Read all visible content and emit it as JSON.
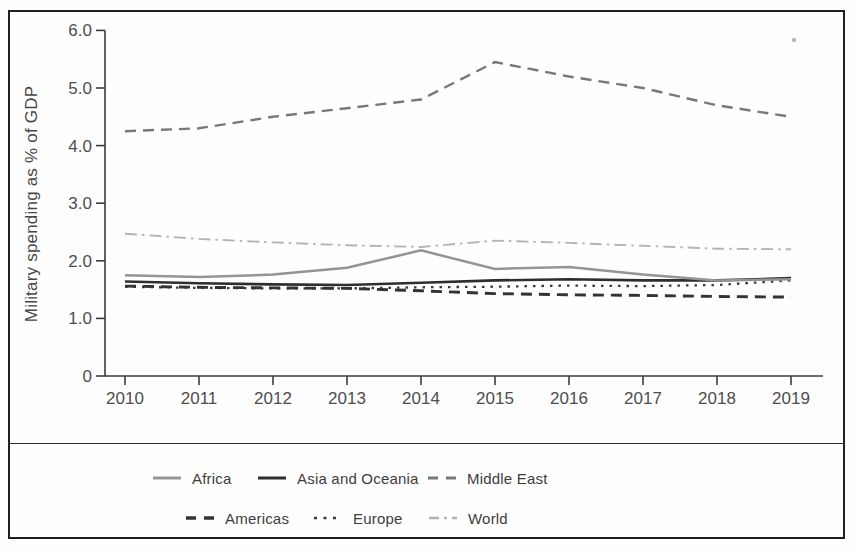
{
  "figure": {
    "background_color": "#fefefe",
    "frame_border_color": "#1f1f1f",
    "axis_color": "#3c3c3c",
    "text_color": "#4d4d4d"
  },
  "chart_data": {
    "type": "line",
    "title": "",
    "ylabel": "Military spending as % of GDP",
    "xlabel": "",
    "grid": false,
    "legend_position": "bottom",
    "ylim": [
      0,
      6
    ],
    "x": [
      2010,
      2011,
      2012,
      2013,
      2014,
      2015,
      2016,
      2017,
      2018,
      2019
    ],
    "x_tick_labels": [
      "2010",
      "2011",
      "2012",
      "2013",
      "2014",
      "2015",
      "2016",
      "2017",
      "2018",
      "2019"
    ],
    "y_ticks": [
      0,
      1,
      2,
      3,
      4,
      5,
      6
    ],
    "y_tick_labels": [
      "0",
      "1.0",
      "2.0",
      "3.0",
      "4.0",
      "5.0",
      "6.0"
    ],
    "series": [
      {
        "name": "Africa",
        "style": "solid",
        "color": "#949494",
        "width": 2.5,
        "values": [
          1.75,
          1.72,
          1.76,
          1.88,
          2.18,
          1.86,
          1.89,
          1.76,
          1.66,
          1.68
        ]
      },
      {
        "name": "Asia and Oceania",
        "style": "solid",
        "color": "#2e2e2e",
        "width": 2.6,
        "values": [
          1.64,
          1.61,
          1.59,
          1.58,
          1.62,
          1.66,
          1.68,
          1.66,
          1.66,
          1.7
        ]
      },
      {
        "name": "Middle East",
        "style": "dashed",
        "color": "#787878",
        "width": 2.4,
        "values": [
          4.25,
          4.3,
          4.5,
          4.65,
          4.8,
          5.45,
          5.2,
          5.0,
          4.7,
          4.5
        ]
      },
      {
        "name": "Americas",
        "style": "dashed",
        "color": "#333333",
        "width": 2.9,
        "values": [
          1.56,
          1.54,
          1.53,
          1.52,
          1.48,
          1.43,
          1.41,
          1.4,
          1.38,
          1.37
        ]
      },
      {
        "name": "Europe",
        "style": "dotted",
        "color": "#3a3a3a",
        "width": 2.3,
        "values": [
          1.55,
          1.53,
          1.52,
          1.52,
          1.54,
          1.55,
          1.57,
          1.56,
          1.58,
          1.66
        ]
      },
      {
        "name": "World",
        "style": "dashdot",
        "color": "#b4b4b4",
        "width": 1.9,
        "values": [
          2.47,
          2.38,
          2.32,
          2.27,
          2.24,
          2.35,
          2.31,
          2.26,
          2.21,
          2.2
        ]
      }
    ],
    "legend_rows": [
      [
        "Africa",
        "Asia and Oceania",
        "Middle East"
      ],
      [
        "Americas",
        "Europe",
        "World"
      ]
    ]
  }
}
